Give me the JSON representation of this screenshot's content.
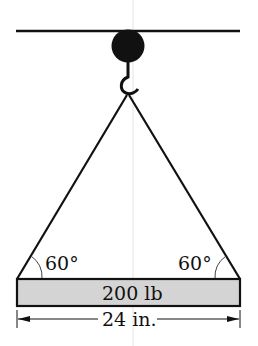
{
  "diagram": {
    "left_angle": "60°",
    "right_angle": "60°",
    "weight_label": "200 lb",
    "width_label": "24 in.",
    "colors": {
      "ink": "#111111",
      "bar_fill": "#d4d4d4"
    }
  }
}
